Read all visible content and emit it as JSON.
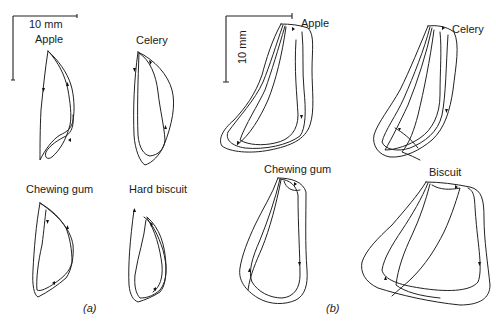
{
  "figure": {
    "panels": [
      {
        "id": "a",
        "label": "(a)",
        "scale_bar": "10 mm",
        "tracings": [
          {
            "name": "Apple"
          },
          {
            "name": "Celery"
          },
          {
            "name": "Chewing gum"
          },
          {
            "name": "Hard biscuit"
          }
        ]
      },
      {
        "id": "b",
        "label": "(b)",
        "scale_bar": "10 mm",
        "tracings": [
          {
            "name": "Apple"
          },
          {
            "name": "Celery"
          },
          {
            "name": "Chewing gum"
          },
          {
            "name": "Biscuit"
          }
        ]
      }
    ],
    "colors": {
      "ink": "#1a1a1a",
      "background": "#ffffff"
    }
  }
}
